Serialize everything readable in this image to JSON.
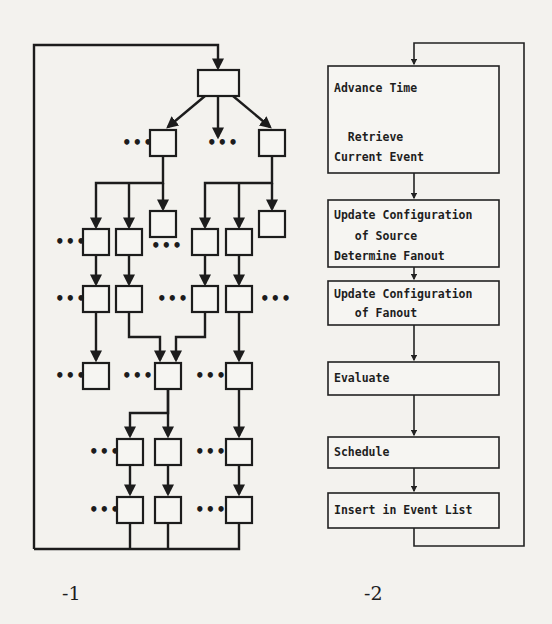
{
  "figure_left": {
    "label": "-1",
    "description": "Tree of unlabeled event-propagation boxes with ellipses and a feedback loop",
    "ellipsis": "•••"
  },
  "figure_right": {
    "label": "-2",
    "steps": [
      {
        "lines": [
          "Advance Time",
          "",
          "  Retrieve",
          "Current Event"
        ]
      },
      {
        "lines": [
          "Update Configuration",
          "   of Source",
          "Determine Fanout"
        ]
      },
      {
        "lines": [
          "Update Configuration",
          "   of Fanout"
        ]
      },
      {
        "lines": [
          "Evaluate"
        ]
      },
      {
        "lines": [
          "Schedule"
        ]
      },
      {
        "lines": [
          "Insert in Event List"
        ]
      }
    ]
  },
  "colors": {
    "ink": "#1c1c1c",
    "paper": "#f3f2ee"
  }
}
